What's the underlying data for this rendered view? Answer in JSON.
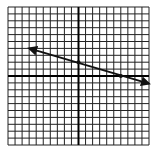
{
  "chart_data": {
    "type": "line",
    "title": "",
    "xlabel": "",
    "ylabel": "",
    "grid": true,
    "xlim": [
      -10,
      10
    ],
    "ylim": [
      -10,
      10
    ],
    "grid_step": 1,
    "series": [
      {
        "name": "line",
        "kind": "line-with-arrows-both-ends",
        "x": [
          -7,
          0,
          6,
          10
        ],
        "y": [
          4,
          2,
          0,
          -1.1
        ],
        "marked_points": [
          [
            0,
            2
          ],
          [
            6,
            0
          ]
        ],
        "slope": -0.3333,
        "intercept": 2
      }
    ]
  },
  "colors": {
    "grid": "#222222",
    "axis": "#000000",
    "line": "#111111",
    "background": "#ffffff"
  }
}
